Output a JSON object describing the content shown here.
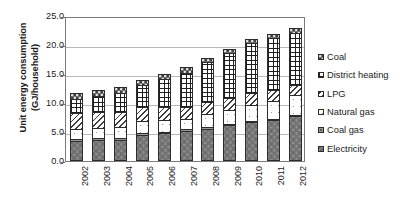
{
  "chart_data": {
    "type": "bar",
    "subtype": "stacked-column",
    "title": "",
    "xlabel": "",
    "ylabel": "Unit energy consumption (GJ/household)",
    "ylabel_lines": [
      "Unit energy consumption",
      "(GJ/household)"
    ],
    "categories": [
      "2002",
      "2003",
      "2004",
      "2005",
      "2006",
      "2007",
      "2008",
      "2009",
      "2010",
      "2011",
      "2012"
    ],
    "ylim": [
      0.0,
      25.0
    ],
    "ytick_labels": [
      "0.0",
      "5.0",
      "10.0",
      "15.0",
      "20.0",
      "25.0"
    ],
    "ytick_values": [
      0.0,
      5.0,
      10.0,
      15.0,
      20.0,
      25.0
    ],
    "grid": true,
    "grid_axis": "y",
    "legend_position": "right",
    "stack_order_bottom_to_top": [
      "Electricity",
      "Coal gas",
      "Natural gas",
      "LPG",
      "District heating",
      "Coal"
    ],
    "series": [
      {
        "name": "Electricity",
        "key": "electricity",
        "pattern": "dark-gray-circles",
        "color": "#8e8e8e",
        "values": [
          3.5,
          3.7,
          3.7,
          4.5,
          4.8,
          5.2,
          5.6,
          6.2,
          6.7,
          7.0,
          7.7
        ]
      },
      {
        "name": "Coal gas",
        "key": "coalgas",
        "pattern": "mid-gray-fine-dots",
        "color": "#9a9a9a",
        "values": [
          0.25,
          0.25,
          0.25,
          0.25,
          0.25,
          0.25,
          0.25,
          0.25,
          0.25,
          0.25,
          0.25
        ]
      },
      {
        "name": "Natural gas",
        "key": "naturalgas",
        "pattern": "white-blank",
        "color": "#ffffff",
        "values": [
          1.7,
          1.8,
          1.9,
          2.1,
          2.0,
          1.8,
          2.2,
          2.3,
          2.7,
          3.1,
          3.5
        ]
      },
      {
        "name": "LPG",
        "key": "lpg",
        "pattern": "light-diagonal-hatch",
        "color": "#fdfdfd",
        "values": [
          2.8,
          2.7,
          2.6,
          2.4,
          2.3,
          2.1,
          2.1,
          2.1,
          2.0,
          1.9,
          1.7
        ]
      },
      {
        "name": "District heating",
        "key": "districtheating",
        "pattern": "black-grid-crosshatch",
        "color": "#ffffff",
        "values": [
          2.5,
          2.8,
          3.2,
          3.9,
          4.8,
          5.9,
          6.9,
          7.8,
          8.7,
          8.9,
          9.0
        ]
      },
      {
        "name": "Coal",
        "key": "coal",
        "pattern": "dark-gray-speckle",
        "color": "#757575",
        "values": [
          1.0,
          1.0,
          1.1,
          0.9,
          0.9,
          0.9,
          0.7,
          0.7,
          0.7,
          0.7,
          0.8
        ]
      }
    ],
    "totals": [
      11.75,
      12.25,
      12.75,
      14.05,
      15.05,
      16.15,
      17.75,
      19.35,
      21.05,
      21.85,
      22.95
    ],
    "legend_entries": [
      {
        "label": "Coal",
        "key": "coal"
      },
      {
        "label": "District heating",
        "key": "districtheating"
      },
      {
        "label": "LPG",
        "key": "lpg"
      },
      {
        "label": "Natural gas",
        "key": "naturalgas"
      },
      {
        "label": "Coal gas",
        "key": "coalgas"
      },
      {
        "label": "Electricity",
        "key": "electricity"
      }
    ]
  }
}
